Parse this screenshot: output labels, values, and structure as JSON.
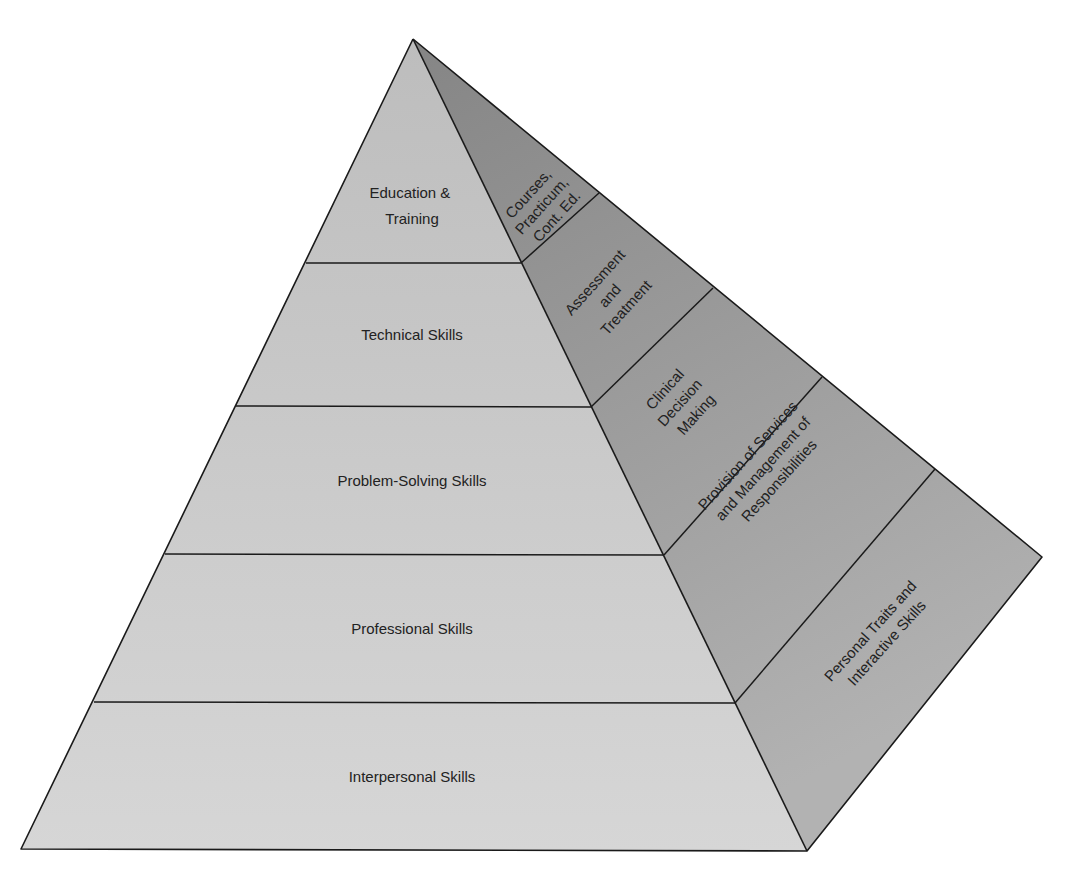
{
  "diagram": {
    "type": "pyramid",
    "colors": {
      "front_top": "#bdbdbd",
      "front_bottom": "#d6d6d6",
      "side_top": "#858585",
      "side_bottom": "#b2b2b2",
      "line": "#1a1a1a",
      "text": "#222222"
    },
    "front_layers": [
      {
        "label_lines": [
          "Education &",
          "Training"
        ]
      },
      {
        "label_lines": [
          "Technical Skills"
        ]
      },
      {
        "label_lines": [
          "Problem-Solving Skills"
        ]
      },
      {
        "label_lines": [
          "Professional Skills"
        ]
      },
      {
        "label_lines": [
          "Interpersonal Skills"
        ]
      }
    ],
    "side_layers": [
      {
        "label_lines": [
          "Courses,",
          "Practicum,",
          "Cont. Ed."
        ]
      },
      {
        "label_lines": [
          "Assessment",
          "and",
          "Treatment"
        ]
      },
      {
        "label_lines": [
          "Clinical",
          "Decision",
          "Making"
        ]
      },
      {
        "label_lines": [
          "Provision of Services",
          "and Management of",
          "Responsibilities"
        ]
      },
      {
        "label_lines": [
          "Personal Traits and",
          "Interactive Skills"
        ]
      }
    ]
  }
}
